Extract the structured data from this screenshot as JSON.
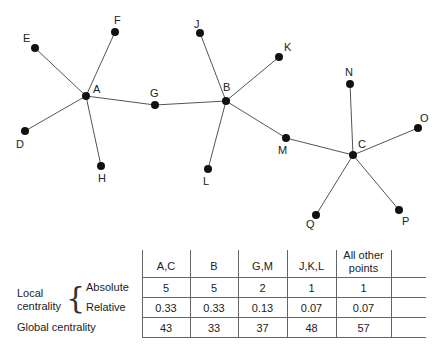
{
  "graph": {
    "nodes": [
      {
        "id": "A",
        "x": 86,
        "y": 96,
        "lx": 93,
        "ly": 93
      },
      {
        "id": "B",
        "x": 226,
        "y": 101,
        "lx": 223,
        "ly": 91
      },
      {
        "id": "C",
        "x": 353,
        "y": 155,
        "lx": 358,
        "ly": 148
      },
      {
        "id": "D",
        "x": 25,
        "y": 131,
        "lx": 16,
        "ly": 148
      },
      {
        "id": "E",
        "x": 35,
        "y": 48,
        "lx": 23,
        "ly": 42
      },
      {
        "id": "F",
        "x": 115,
        "y": 32,
        "lx": 114,
        "ly": 24
      },
      {
        "id": "G",
        "x": 155,
        "y": 105,
        "lx": 150,
        "ly": 97
      },
      {
        "id": "H",
        "x": 101,
        "y": 166,
        "lx": 98,
        "ly": 182
      },
      {
        "id": "J",
        "x": 200,
        "y": 33,
        "lx": 194,
        "ly": 28
      },
      {
        "id": "K",
        "x": 279,
        "y": 57,
        "lx": 284,
        "ly": 51
      },
      {
        "id": "L",
        "x": 208,
        "y": 169,
        "lx": 203,
        "ly": 185
      },
      {
        "id": "M",
        "x": 286,
        "y": 138,
        "lx": 278,
        "ly": 154
      },
      {
        "id": "N",
        "x": 350,
        "y": 84,
        "lx": 345,
        "ly": 76
      },
      {
        "id": "O",
        "x": 418,
        "y": 128,
        "lx": 420,
        "ly": 122
      },
      {
        "id": "P",
        "x": 399,
        "y": 210,
        "lx": 402,
        "ly": 225
      },
      {
        "id": "Q",
        "x": 316,
        "y": 215,
        "lx": 306,
        "ly": 228
      }
    ],
    "edges": [
      [
        "A",
        "E"
      ],
      [
        "A",
        "F"
      ],
      [
        "A",
        "D"
      ],
      [
        "A",
        "H"
      ],
      [
        "A",
        "G"
      ],
      [
        "G",
        "B"
      ],
      [
        "B",
        "J"
      ],
      [
        "B",
        "K"
      ],
      [
        "B",
        "L"
      ],
      [
        "B",
        "M"
      ],
      [
        "M",
        "C"
      ],
      [
        "C",
        "N"
      ],
      [
        "C",
        "O"
      ],
      [
        "C",
        "P"
      ],
      [
        "C",
        "Q"
      ]
    ]
  },
  "table": {
    "columns": [
      "A,C",
      "B",
      "G,M",
      "J,K,L",
      "All other points"
    ],
    "columns_line1": [
      "A,C",
      "B",
      "G,M",
      "J,K,L",
      "All other"
    ],
    "columns_line2": [
      "",
      "",
      "",
      "",
      "points"
    ],
    "group_label_line1": "Local",
    "group_label_line2": "centrality",
    "rows": [
      {
        "label": "Absolute",
        "values": [
          "5",
          "5",
          "2",
          "1",
          "1"
        ]
      },
      {
        "label": "Relative",
        "values": [
          "0.33",
          "0.33",
          "0.13",
          "0.07",
          "0.07"
        ]
      },
      {
        "label": "Global centrality",
        "values": [
          "43",
          "33",
          "37",
          "48",
          "57"
        ]
      }
    ]
  }
}
